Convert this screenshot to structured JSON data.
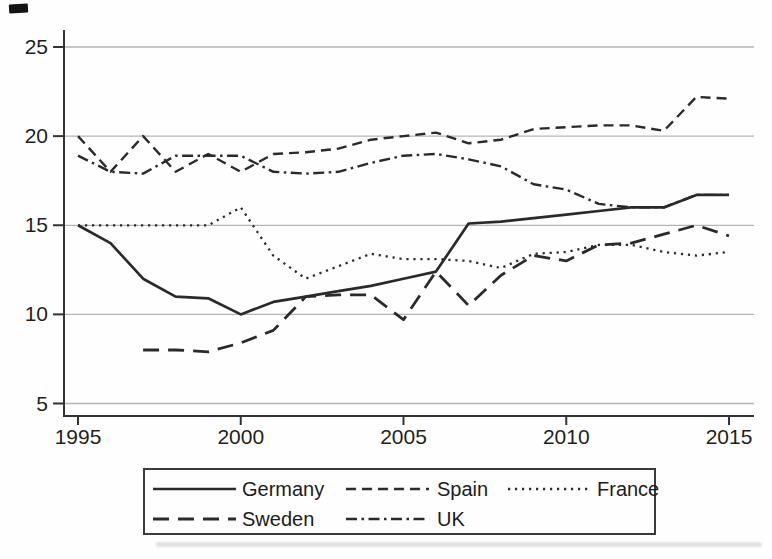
{
  "figure": {
    "background": "#fefefe",
    "axis_color": "#333333",
    "tick_label_color": "#1f1f1f"
  },
  "chart_data": {
    "type": "line",
    "title": "",
    "xlabel": "",
    "ylabel": "",
    "x": [
      1995,
      1996,
      1997,
      1998,
      1999,
      2000,
      2001,
      2002,
      2003,
      2004,
      2005,
      2006,
      2007,
      2008,
      2009,
      2010,
      2011,
      2012,
      2013,
      2014,
      2015
    ],
    "x_ticks": [
      1995,
      2000,
      2005,
      2010,
      2015
    ],
    "y_ticks": [
      5,
      10,
      15,
      20,
      25
    ],
    "ylim": [
      5,
      25
    ],
    "xlim": [
      1995,
      2015
    ],
    "grid": "horizontal",
    "grid_color": "#b5b5b5",
    "line_color": "#2a2a2a",
    "legend_position": "bottom",
    "legend_rows": [
      [
        "Germany",
        "Spain",
        "France"
      ],
      [
        "Sweden",
        "UK"
      ]
    ],
    "series": [
      {
        "name": "Germany",
        "style": "solid",
        "values": [
          15.0,
          14.0,
          12.0,
          11.0,
          10.9,
          10.0,
          10.7,
          11.0,
          11.3,
          11.6,
          12.0,
          12.4,
          15.1,
          15.2,
          15.4,
          15.6,
          15.8,
          16.0,
          16.0,
          16.7,
          16.7
        ]
      },
      {
        "name": "Spain",
        "style": "dashed",
        "values": [
          20.0,
          18.0,
          20.0,
          18.0,
          19.0,
          18.0,
          19.0,
          19.1,
          19.3,
          19.8,
          20.0,
          20.2,
          19.6,
          19.8,
          20.4,
          20.5,
          20.6,
          20.6,
          20.3,
          22.2,
          22.1
        ]
      },
      {
        "name": "France",
        "style": "dotted",
        "values": [
          15.0,
          15.0,
          15.0,
          15.0,
          15.0,
          16.0,
          13.3,
          12.0,
          12.7,
          13.4,
          13.1,
          13.1,
          13.0,
          12.6,
          13.4,
          13.5,
          13.9,
          13.9,
          13.5,
          13.3,
          13.5
        ]
      },
      {
        "name": "Sweden",
        "style": "long-dash",
        "values": [
          null,
          null,
          8.0,
          8.0,
          7.9,
          8.4,
          9.1,
          11.0,
          11.1,
          11.1,
          9.7,
          12.4,
          10.5,
          12.2,
          13.3,
          13.0,
          13.9,
          14.0,
          14.5,
          15.0,
          14.4
        ]
      },
      {
        "name": "UK",
        "style": "dash-dot",
        "values": [
          18.9,
          18.0,
          17.9,
          18.9,
          18.9,
          18.9,
          18.0,
          17.9,
          18.0,
          18.5,
          18.9,
          19.0,
          18.7,
          18.3,
          17.3,
          17.0,
          16.2,
          16.0,
          16.0,
          16.7,
          16.7
        ]
      }
    ]
  }
}
